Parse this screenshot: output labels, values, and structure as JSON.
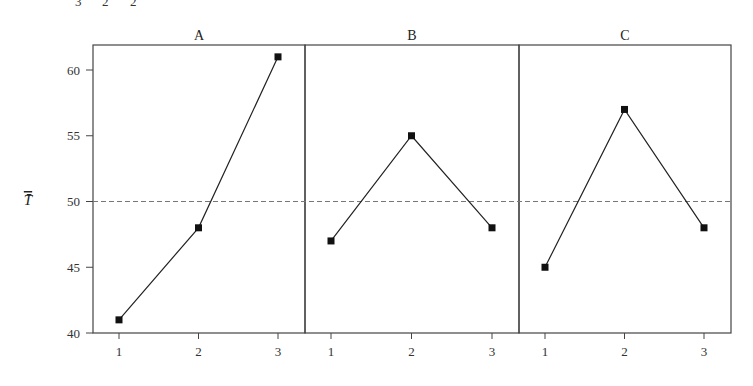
{
  "clipped_header": {
    "fragments": [
      "3",
      "2",
      "2"
    ]
  },
  "chart_data": {
    "type": "line",
    "title": "",
    "ylabel": "T̄",
    "xlabel": "",
    "ylim": [
      40,
      62
    ],
    "yticks": [
      40,
      45,
      50,
      55,
      60
    ],
    "ytick_labels": [
      "40",
      "45",
      "50",
      "55",
      "60"
    ],
    "grid": false,
    "reference_line": {
      "y": 50,
      "style": "dashed"
    },
    "panels": [
      {
        "name": "A",
        "categories": [
          "1",
          "2",
          "3"
        ],
        "values": [
          41,
          48,
          61
        ]
      },
      {
        "name": "B",
        "categories": [
          "1",
          "2",
          "3"
        ],
        "values": [
          47,
          55,
          48
        ]
      },
      {
        "name": "C",
        "categories": [
          "1",
          "2",
          "3"
        ],
        "values": [
          45,
          57,
          48
        ]
      }
    ],
    "colors": {
      "line": "#222222",
      "marker": "#111111",
      "frame": "#444444",
      "reference": "#777777"
    }
  }
}
